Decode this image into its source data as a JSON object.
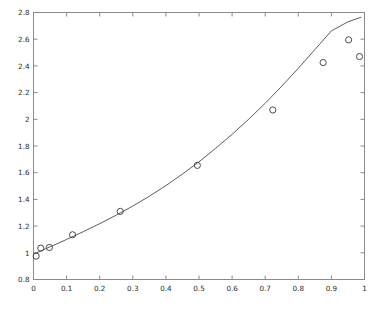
{
  "figure": {
    "background_color": "#ffffff",
    "axes_color": "#8a8a8a",
    "line_color": "#4a4a4a",
    "marker_color": "#3a3a3a",
    "title": "",
    "width": 380,
    "height": 318
  },
  "chart_data": {
    "type": "scatter",
    "title": "",
    "xlabel": "",
    "ylabel": "",
    "xlim": [
      0,
      1
    ],
    "ylim": [
      0.8,
      2.8
    ],
    "grid": false,
    "legend": null,
    "xticks": [
      0,
      0.1,
      0.2,
      0.3,
      0.4,
      0.5,
      0.6,
      0.7,
      0.8,
      0.9,
      1
    ],
    "xticklabels": [
      "0",
      "0.1",
      "0.2",
      "0.3",
      "0.4",
      "0.5",
      "0.6",
      "0.7",
      "0.8",
      "0.9",
      "1"
    ],
    "yticks": [
      0.8,
      1.0,
      1.2,
      1.4,
      1.6,
      1.8,
      2.0,
      2.2,
      2.4,
      2.6,
      2.8
    ],
    "yticklabels": [
      "0.8",
      "1",
      "1.2",
      "1.4",
      "1.6",
      "1.8",
      "2",
      "2.2",
      "2.4",
      "2.6",
      "2.8"
    ],
    "series": [
      {
        "name": "data",
        "marker": "circle-open",
        "style": "markers",
        "x": [
          0.008,
          0.022,
          0.048,
          0.118,
          0.262,
          0.495,
          0.723,
          0.875,
          0.952,
          0.985
        ],
        "y": [
          0.975,
          1.035,
          1.04,
          1.135,
          1.31,
          1.655,
          2.07,
          2.425,
          2.595,
          2.47
        ]
      },
      {
        "name": "fit",
        "marker": "none",
        "style": "line",
        "x": [
          0.0,
          0.05,
          0.1,
          0.15,
          0.2,
          0.25,
          0.3,
          0.35,
          0.4,
          0.45,
          0.5,
          0.55,
          0.6,
          0.65,
          0.7,
          0.75,
          0.8,
          0.85,
          0.9,
          0.95,
          0.99
        ],
        "y": [
          0.99,
          1.045,
          1.1,
          1.158,
          1.218,
          1.282,
          1.35,
          1.424,
          1.503,
          1.59,
          1.682,
          1.782,
          1.888,
          2.0,
          2.12,
          2.248,
          2.382,
          2.522,
          2.662,
          2.73,
          2.765
        ]
      }
    ]
  }
}
